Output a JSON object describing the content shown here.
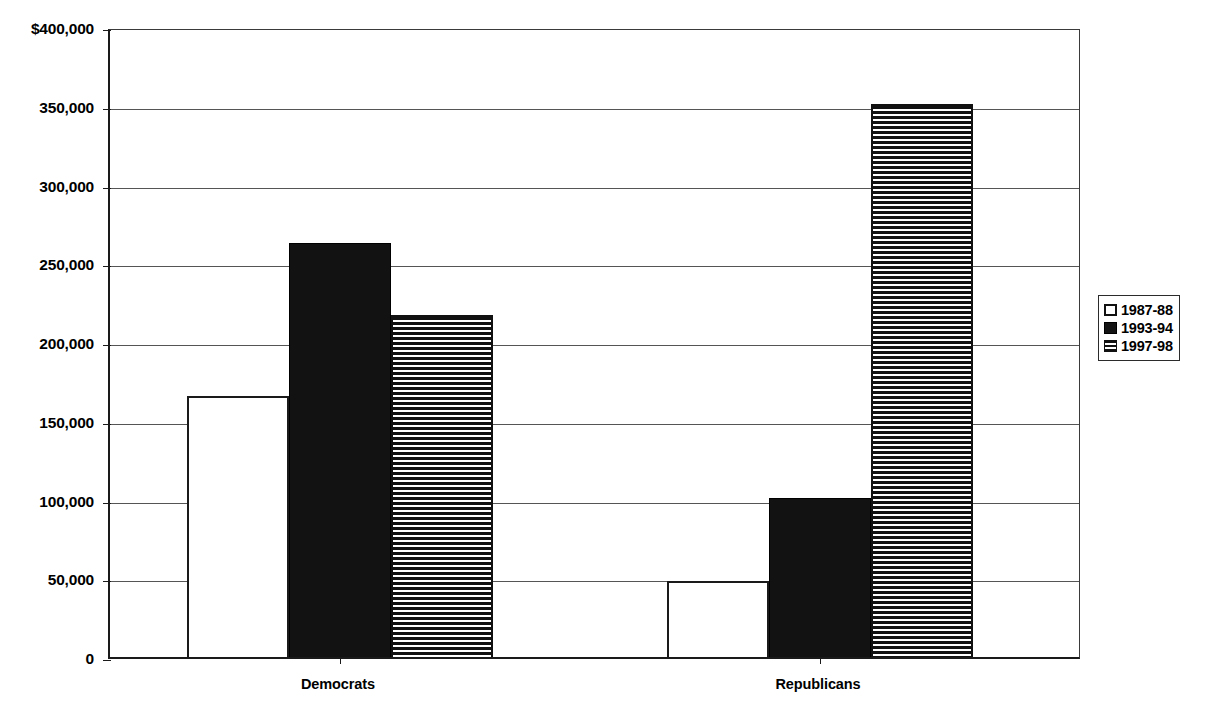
{
  "chart_data": {
    "type": "bar",
    "title": "",
    "subtitle": "",
    "xlabel": "",
    "ylabel": "",
    "categories": [
      "Democrats",
      "Republicans"
    ],
    "series": [
      {
        "name": "1987-88",
        "style": "open",
        "values": [
          166000,
          48000
        ]
      },
      {
        "name": "1993-94",
        "style": "solid",
        "values": [
          263000,
          101000
        ]
      },
      {
        "name": "1997-98",
        "style": "striped",
        "values": [
          217000,
          351000
        ]
      }
    ],
    "ylim": [
      0,
      400000
    ],
    "y_ticks": [
      0,
      50000,
      100000,
      150000,
      200000,
      250000,
      300000,
      350000,
      400000
    ],
    "y_tick_labels": [
      "0",
      "50,000",
      "100,000",
      "150,000",
      "200,000",
      "250,000",
      "300,000",
      "350,000",
      "$400,000"
    ],
    "grid": true,
    "legend_position": "right",
    "currency_symbol": "$"
  },
  "legend": {
    "items": [
      {
        "label": "1987-88",
        "style": "open"
      },
      {
        "label": "1993-94",
        "style": "solid"
      },
      {
        "label": "1997-98",
        "style": "striped"
      }
    ]
  },
  "colors": {
    "axis": "#1a1a1a",
    "gridline": "#555555",
    "bar_fill_solid": "#121212",
    "bar_fill_open": "#ffffff",
    "background": "#ffffff"
  }
}
